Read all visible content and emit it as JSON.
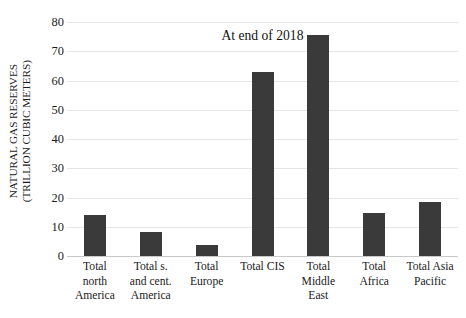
{
  "chart_data": {
    "type": "bar",
    "title": "At end of 2018",
    "xlabel": "",
    "ylabel": "NATURAL GAS RESERVES (TRILLION CUBIC METERS)",
    "ylabel_lines": [
      "NATURAL GAS RESERVES",
      "(TRILLION CUBIC METERS)"
    ],
    "categories": [
      "Total north America",
      "Total s. and cent. America",
      "Total Europe",
      "Total CIS",
      "Total Middle East",
      "Total Africa",
      "Total Asia Pacific"
    ],
    "category_label_lines": [
      [
        "Total",
        "north",
        "America"
      ],
      [
        "Total s.",
        "and cent.",
        "America"
      ],
      [
        "Total",
        "Europe"
      ],
      [
        "Total CIS"
      ],
      [
        "Total",
        "Middle",
        "East"
      ],
      [
        "Total",
        "Africa"
      ],
      [
        "Total Asia",
        "Pacific"
      ]
    ],
    "values": [
      14.0,
      8.2,
      3.9,
      62.8,
      75.6,
      14.7,
      18.3
    ],
    "ylim": [
      0,
      80
    ],
    "yticks": [
      0,
      10,
      20,
      30,
      40,
      50,
      60,
      70,
      80
    ],
    "ytick_labels": [
      "0",
      "10",
      "20",
      "30",
      "40",
      "50",
      "60",
      "70",
      "80"
    ],
    "grid": true,
    "grid_axis": "y",
    "legend": false,
    "bar_color": "#3a3a3a",
    "gridline_color": "#e6e6e6",
    "background_color": "#ffffff"
  }
}
